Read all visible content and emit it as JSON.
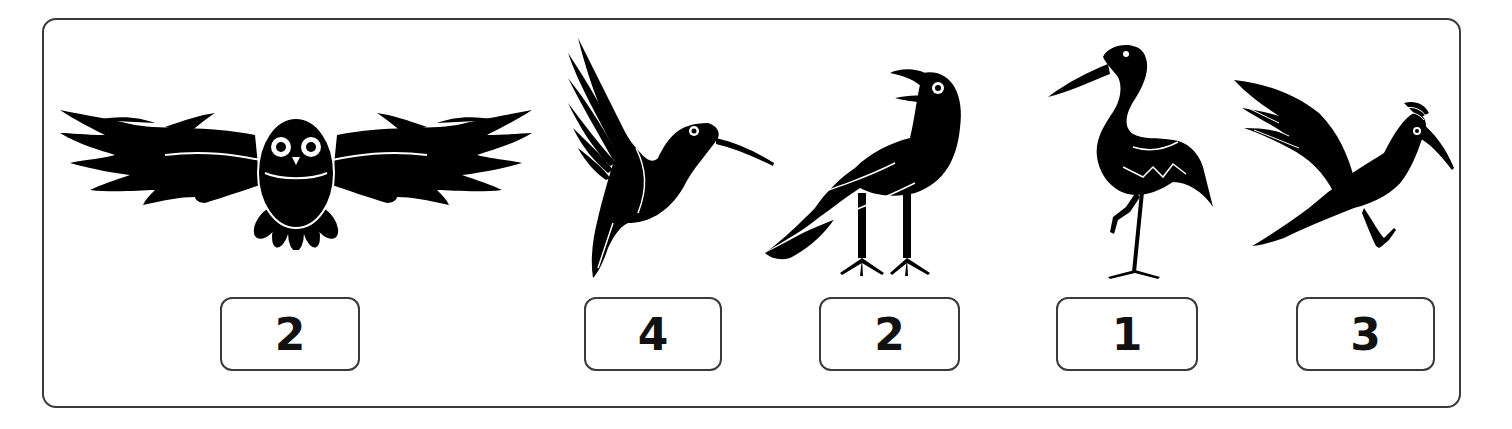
{
  "puzzle": {
    "items": [
      {
        "name": "owl",
        "icon": "owl-icon",
        "number": "2"
      },
      {
        "name": "hummingbird",
        "icon": "hummingbird-icon",
        "number": "4"
      },
      {
        "name": "crow",
        "icon": "crow-icon",
        "number": "2"
      },
      {
        "name": "stork",
        "icon": "stork-icon",
        "number": "1"
      },
      {
        "name": "kingfisher",
        "icon": "kingfisher-icon",
        "number": "3"
      }
    ],
    "colors": {
      "silhouette": "#000000",
      "border": "#3a3a3a",
      "background": "#ffffff"
    }
  }
}
